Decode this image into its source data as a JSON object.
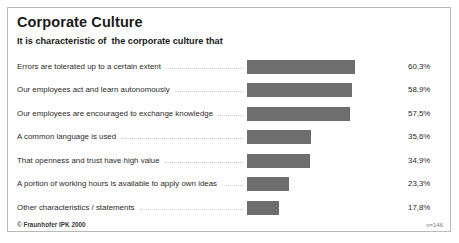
{
  "chart_data": {
    "type": "bar",
    "orientation": "horizontal",
    "title": "Corporate Culture",
    "subtitle": "It is characteristic of  the corporate culture that",
    "xlabel": "",
    "ylabel": "",
    "xlim": [
      0,
      60.3
    ],
    "grid": false,
    "legend": null,
    "value_suffix": "%",
    "decimal_separator": ",",
    "categories": [
      "Errors are tolerated up to a certain extent",
      "Our employees act and learn autonomously",
      "Our employees are encouraged to exchange knowledge",
      "A common language is used",
      "That openness and trust have high value",
      "A portion of working hours is available to apply own ideas",
      "Other characteristics / statements"
    ],
    "values": [
      60.3,
      58.9,
      57.5,
      35.6,
      34.9,
      23.3,
      17.8
    ],
    "value_labels": [
      "60,3%",
      "58,9%",
      "57,5%",
      "35,6%",
      "34,9%",
      "23,3%",
      "17,8%"
    ],
    "bar_color": "#6e6e6e",
    "max_bar_px": 108,
    "annotations": {
      "copyright": "© Fraunhofer IPK 2000",
      "sample_size": "n=146"
    }
  }
}
